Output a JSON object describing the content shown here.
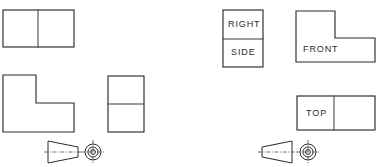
{
  "drawing": {
    "title": "Orthographic Projection View Arrangement",
    "line_color": "#2b2b2b",
    "background_color": "#ffffff",
    "text_color": "#2b2b2b"
  },
  "left_group": {
    "name": "unlabeled-projection-group",
    "top_view": {
      "label": "",
      "shape": "rectangle-divided-vertically",
      "x": 3,
      "y": 10,
      "width": 71,
      "height": 37,
      "divider_x": 38
    },
    "front_view": {
      "label": "",
      "shape": "L-shape",
      "points": "3,75 36,75 36,103 74,103 74,132 3,132"
    },
    "side_view": {
      "label": "",
      "shape": "rectangle-divided-horizontally",
      "x": 108,
      "y": 76,
      "width": 36,
      "height": 56,
      "divider_y": 104
    },
    "projection_symbol": {
      "name": "third-angle-projection-symbol",
      "cone_direction": "points-right",
      "cone": "48,141 48,163 78,157 78,147",
      "circle_center_x": 93,
      "circle_center_y": 152,
      "circle_outer_r": 8,
      "circle_mid_r": 5,
      "circle_inner_r": 2.4
    }
  },
  "right_group": {
    "name": "labeled-projection-group",
    "side_view": {
      "label_top": "RIGHT",
      "label_bottom": "SIDE",
      "shape": "rectangle-divided-horizontally",
      "x": 223,
      "y": 10,
      "width": 40,
      "height": 57,
      "divider_y": 39
    },
    "front_view": {
      "label": "FRONT",
      "shape": "L-shape",
      "points": "296,11 335,11 335,38 375,38 375,62 296,62"
    },
    "top_view": {
      "label": "TOP",
      "shape": "rectangle-divided-vertically",
      "x": 297,
      "y": 96,
      "width": 78,
      "height": 34,
      "divider_x": 334
    },
    "projection_symbol": {
      "name": "first-angle-projection-symbol",
      "cone_direction": "points-left",
      "cone": "262,147 262,157 292,163 292,141",
      "circle_center_x": 308,
      "circle_center_y": 152,
      "circle_outer_r": 8,
      "circle_mid_r": 5,
      "circle_inner_r": 2.4
    }
  },
  "labels": {
    "right": "RIGHT",
    "side": "SIDE",
    "front": "FRONT",
    "top": "TOP"
  }
}
